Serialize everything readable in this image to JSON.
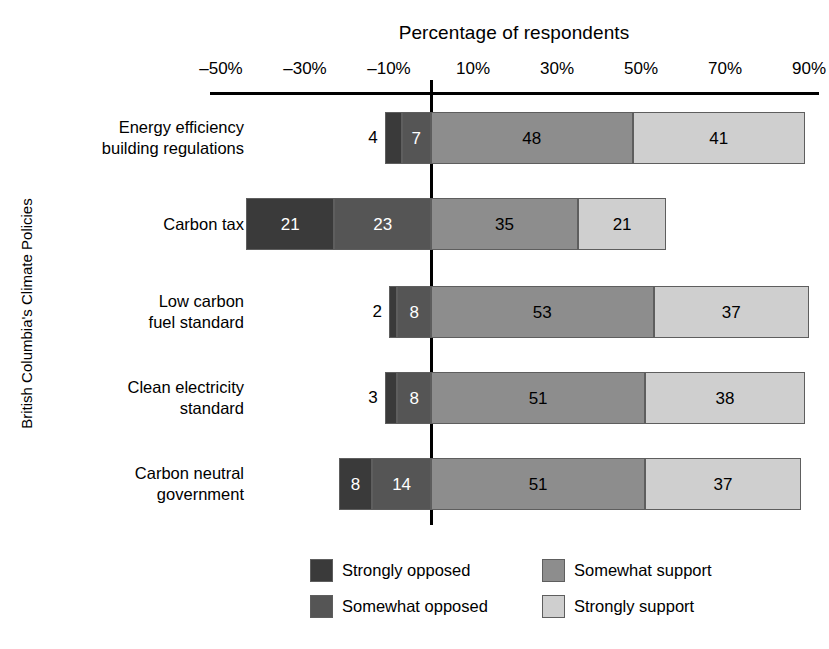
{
  "chart_data": {
    "type": "bar",
    "subtype": "diverging-stacked-bar",
    "title": "Percentage of respondents",
    "xlabel": "Percentage of respondents",
    "ylabel": "British Columbia's Climate Policies",
    "orientation": "horizontal",
    "stacked": true,
    "grid": false,
    "legend_position": "bottom",
    "xlim": [
      -50,
      90
    ],
    "xticks": [
      -50,
      -30,
      -10,
      10,
      30,
      50,
      70,
      90
    ],
    "xtick_labels": [
      "–50%",
      "–30%",
      "–10%",
      "10%",
      "30%",
      "50%",
      "70%",
      "90%"
    ],
    "zero_reference": 0,
    "categories": [
      "Energy efficiency\nbuilding regulations",
      "Carbon tax",
      "Low carbon\nfuel standard",
      "Clean electricity\nstandard",
      "Carbon neutral\ngovernment"
    ],
    "series": [
      {
        "name": "Strongly opposed",
        "color": "#3a3a3a",
        "side": "negative",
        "values": [
          4,
          21,
          2,
          3,
          8
        ]
      },
      {
        "name": "Somewhat opposed",
        "color": "#555555",
        "side": "negative",
        "values": [
          7,
          23,
          8,
          8,
          14
        ]
      },
      {
        "name": "Somewhat support",
        "color": "#8d8d8d",
        "side": "positive",
        "values": [
          48,
          35,
          53,
          51,
          51
        ]
      },
      {
        "name": "Strongly support",
        "color": "#cfcfcf",
        "side": "positive",
        "values": [
          41,
          21,
          37,
          38,
          37
        ]
      }
    ],
    "bars": [
      {
        "category": "Energy efficiency\nbuilding regulations",
        "segments": [
          {
            "series": "Strongly opposed",
            "value": 4,
            "label": "4",
            "label_placement": "outside-left"
          },
          {
            "series": "Somewhat opposed",
            "value": 7,
            "label": "7",
            "label_placement": "inside"
          },
          {
            "series": "Somewhat support",
            "value": 48,
            "label": "48",
            "label_placement": "inside"
          },
          {
            "series": "Strongly support",
            "value": 41,
            "label": "41",
            "label_placement": "inside"
          }
        ]
      },
      {
        "category": "Carbon tax",
        "segments": [
          {
            "series": "Strongly opposed",
            "value": 21,
            "label": "21",
            "label_placement": "inside"
          },
          {
            "series": "Somewhat opposed",
            "value": 23,
            "label": "23",
            "label_placement": "inside"
          },
          {
            "series": "Somewhat support",
            "value": 35,
            "label": "35",
            "label_placement": "inside"
          },
          {
            "series": "Strongly support",
            "value": 21,
            "label": "21",
            "label_placement": "inside"
          }
        ]
      },
      {
        "category": "Low carbon\nfuel standard",
        "segments": [
          {
            "series": "Strongly opposed",
            "value": 2,
            "label": "2",
            "label_placement": "outside-left"
          },
          {
            "series": "Somewhat opposed",
            "value": 8,
            "label": "8",
            "label_placement": "inside"
          },
          {
            "series": "Somewhat support",
            "value": 53,
            "label": "53",
            "label_placement": "inside"
          },
          {
            "series": "Strongly support",
            "value": 37,
            "label": "37",
            "label_placement": "inside"
          }
        ]
      },
      {
        "category": "Clean electricity\nstandard",
        "segments": [
          {
            "series": "Strongly opposed",
            "value": 3,
            "label": "3",
            "label_placement": "outside-left"
          },
          {
            "series": "Somewhat opposed",
            "value": 8,
            "label": "8",
            "label_placement": "inside"
          },
          {
            "series": "Somewhat support",
            "value": 51,
            "label": "51",
            "label_placement": "inside"
          },
          {
            "series": "Strongly support",
            "value": 38,
            "label": "38",
            "label_placement": "inside"
          }
        ]
      },
      {
        "category": "Carbon neutral\ngovernment",
        "segments": [
          {
            "series": "Strongly opposed",
            "value": 8,
            "label": "8",
            "label_placement": "inside"
          },
          {
            "series": "Somewhat opposed",
            "value": 14,
            "label": "14",
            "label_placement": "inside"
          },
          {
            "series": "Somewhat support",
            "value": 51,
            "label": "51",
            "label_placement": "inside"
          },
          {
            "series": "Strongly support",
            "value": 37,
            "label": "37",
            "label_placement": "inside"
          }
        ]
      }
    ],
    "legend": [
      {
        "label": "Strongly opposed",
        "color": "#3a3a3a"
      },
      {
        "label": "Somewhat support",
        "color": "#8d8d8d"
      },
      {
        "label": "Somewhat opposed",
        "color": "#555555"
      },
      {
        "label": "Strongly support",
        "color": "#cfcfcf"
      }
    ]
  },
  "geometry": {
    "zero_x": 431,
    "px_per_unit": 4.2,
    "axis_left": 210,
    "axis_right": 819,
    "axis_y": 92,
    "bar_height": 52,
    "row_tops": [
      112,
      198,
      286,
      372,
      458
    ]
  }
}
